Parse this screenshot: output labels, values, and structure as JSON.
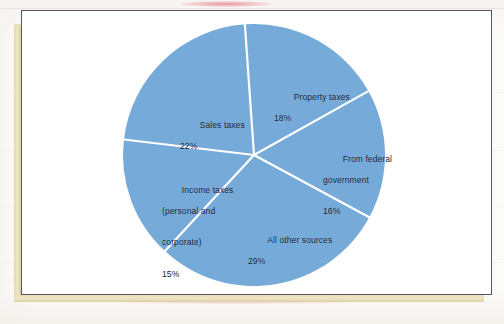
{
  "figure": {
    "background_color": "#fbfbf9",
    "frame_color": "#56565a",
    "page_edge_color": "#e9dfbe"
  },
  "chart_data": {
    "type": "pie",
    "title": "",
    "subtitle": "",
    "xlabel": "",
    "ylabel": "",
    "legend_position": "none",
    "grid": false,
    "units": "percent",
    "total": 100,
    "start_angle_deg": -4,
    "direction": "clockwise",
    "slice_color": "#76abd9",
    "divider_color": "#ffffff",
    "label_color": "#14213a",
    "categories": [
      "Property taxes",
      "From federal government",
      "All other sources",
      "Income taxes (personal and corporate)",
      "Sales taxes"
    ],
    "values": [
      18,
      16,
      29,
      15,
      22
    ],
    "slices": [
      {
        "name": "property-taxes",
        "label_lines": [
          "Property taxes"
        ],
        "value": 18,
        "value_label": "18%",
        "sweep_deg": 64.8,
        "color": "#76abd9"
      },
      {
        "name": "from-federal-government",
        "label_lines": [
          "From federal",
          "government"
        ],
        "value": 16,
        "value_label": "16%",
        "sweep_deg": 57.6,
        "color": "#76abd9"
      },
      {
        "name": "all-other-sources",
        "label_lines": [
          "All other sources"
        ],
        "value": 29,
        "value_label": "29%",
        "sweep_deg": 104.4,
        "color": "#76abd9"
      },
      {
        "name": "income-taxes",
        "label_lines": [
          "Income taxes",
          "(personal and",
          "corporate)"
        ],
        "value": 15,
        "value_label": "15%",
        "sweep_deg": 54.0,
        "color": "#76abd9"
      },
      {
        "name": "sales-taxes",
        "label_lines": [
          "Sales taxes"
        ],
        "value": 22,
        "value_label": "22%",
        "sweep_deg": 79.2,
        "color": "#76abd9"
      }
    ]
  },
  "labels": {
    "property": {
      "line1": "Property taxes",
      "pct": "18%"
    },
    "federal": {
      "line1": "From federal",
      "line2": "government",
      "pct": "16%"
    },
    "other": {
      "line1": "All other sources",
      "pct": "29%"
    },
    "income": {
      "line1": "Income taxes",
      "line2": "(personal and",
      "line3": "corporate)",
      "pct": "15%"
    },
    "sales": {
      "line1": "Sales taxes",
      "pct": "22%"
    }
  }
}
